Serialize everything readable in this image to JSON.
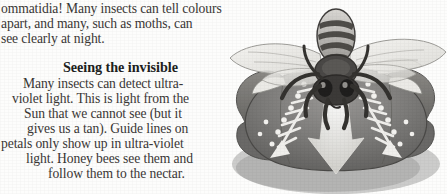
{
  "page": {
    "background_color": "#fdfdfc",
    "text_color": "#3a3735",
    "width": 447,
    "height": 194
  },
  "intro_paragraph": {
    "lines": [
      "ommatidia! Many insects can tell colours",
      "apart, and many, such as moths, can",
      "see clearly at night."
    ]
  },
  "section": {
    "heading": "Seeing the invisible",
    "lines": [
      "Many insects can detect ultra-",
      "violet light. This is light from the",
      "Sun that we cannot see (but it",
      "gives us a tan). Guide lines on",
      "petals only show up in ultra-violet",
      "light. Honey bees see them and",
      "follow them to the nectar."
    ],
    "full_text": "Many insects can detect ultra-violet light. This is light from the Sun that we cannot see (but it gives us a tan). Guide lines on petals only show up in ultra-violet light. Honey bees see them and follow them to the nectar."
  },
  "illustration": {
    "subject": "honey-bee-on-flower",
    "description": "Greyscale drawing of a honey bee with striped abdomen and transparent wings landing on a broad flower whose petals show ultra-violet nectar guide lines and dots",
    "colors": {
      "petal_dark": "#6f6e6c",
      "petal_mid": "#8a8987",
      "petal_shadow": "#575654",
      "guide_line": "#f2f1ee",
      "bee_dark": "#3b3937",
      "bee_light": "#c9c7c3",
      "wing": "#e9e8e4",
      "outline": "#4a4846"
    }
  }
}
